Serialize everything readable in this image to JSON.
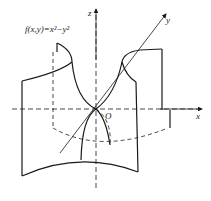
{
  "diagram": {
    "function_label": "f(x,y)=x²−y²",
    "axes": {
      "x_label": "x",
      "y_label": "y",
      "z_label": "z",
      "origin_label": "O"
    },
    "colors": {
      "stroke": "#1a1a1a",
      "background": "#ffffff"
    }
  }
}
